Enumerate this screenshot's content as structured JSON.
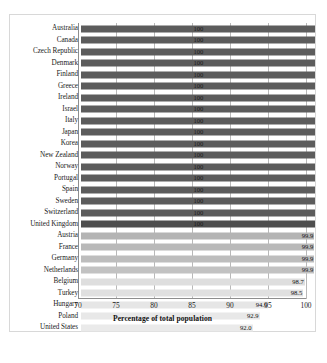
{
  "chart_data": {
    "type": "bar",
    "orientation": "horizontal",
    "title": "",
    "xlabel": "Percentage of total population",
    "ylabel": "",
    "xlim": [
      70,
      100
    ],
    "xticks": [
      "70",
      "75",
      "80",
      "85",
      "90",
      "95",
      "100"
    ],
    "grid": true,
    "legend": false,
    "categories": [
      "Australia",
      "Canada",
      "Czech Republic",
      "Denmark",
      "Finland",
      "Greece",
      "Ireland",
      "Israel",
      "Italy",
      "Japan",
      "Korea",
      "New Zealand",
      "Norway",
      "Portugal",
      "Spain",
      "Sweden",
      "Switzerland",
      "United Kingdom",
      "Austria",
      "France",
      "Germany",
      "Netherlands",
      "Belgium",
      "Turkey",
      "Hungary",
      "Poland",
      "United States"
    ],
    "values": [
      100,
      100,
      100,
      100,
      100,
      100,
      100,
      100,
      100,
      100,
      100,
      100,
      100,
      100,
      100,
      100,
      100,
      100,
      99.9,
      99.9,
      99.9,
      99.9,
      98.7,
      98.5,
      94.0,
      92.9,
      92.0
    ],
    "data_labels": [
      "100",
      "100",
      "100",
      "100",
      "100",
      "100",
      "100",
      "100",
      "100",
      "100",
      "100",
      "100",
      "100",
      "100",
      "100",
      "100",
      "100",
      "100",
      "99.9",
      "99.9",
      "99.9",
      "99.9",
      "98.7",
      "98.5",
      "94.0",
      "92.9",
      "92.0"
    ],
    "bar_colors": [
      "#5c5c5c",
      "#5c5c5c",
      "#5c5c5c",
      "#5c5c5c",
      "#5c5c5c",
      "#5c5c5c",
      "#5c5c5c",
      "#5c5c5c",
      "#5c5c5c",
      "#5c5c5c",
      "#5c5c5c",
      "#5c5c5c",
      "#5c5c5c",
      "#5c5c5c",
      "#5c5c5c",
      "#5c5c5c",
      "#5c5c5c",
      "#4e4e4e",
      "#b4b4b4",
      "#b9b9b9",
      "#bdbdbd",
      "#c2c2c2",
      "#dedede",
      "#e0e0e0",
      "#e6e6e6",
      "#e8e8e8",
      "#eaeaea"
    ]
  }
}
